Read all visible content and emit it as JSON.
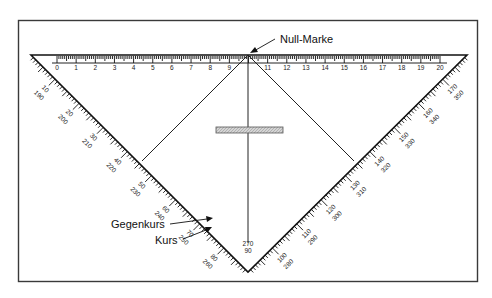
{
  "figure": {
    "labels": {
      "null_marke": "Null-Marke",
      "gegenkurs": "Gegenkurs",
      "kurs": "Kurs"
    },
    "ruler": {
      "unit": "cm",
      "numbers": [
        "0",
        "1",
        "2",
        "3",
        "4",
        "5",
        "6",
        "7",
        "8",
        "9",
        "10",
        "11",
        "12",
        "13",
        "14",
        "15",
        "16",
        "17",
        "18",
        "19",
        "20"
      ],
      "hidden_center_number": "10"
    },
    "left_scale": {
      "outer": [
        "190",
        "200",
        "210",
        "220",
        "230",
        "240",
        "250",
        "260"
      ],
      "inner": [
        "10",
        "20",
        "30",
        "40",
        "50",
        "60",
        "70",
        "80"
      ]
    },
    "right_scale": {
      "outer": [
        "280",
        "290",
        "300",
        "310",
        "320",
        "330",
        "340",
        "350"
      ],
      "inner": [
        "100",
        "110",
        "120",
        "130",
        "140",
        "150",
        "160",
        "170"
      ]
    },
    "apex": {
      "outer": "270",
      "inner": "90"
    },
    "colors": {
      "line": "#111111",
      "frame": "#3a3a3a",
      "bar_fill": "#c8c8c8"
    }
  }
}
